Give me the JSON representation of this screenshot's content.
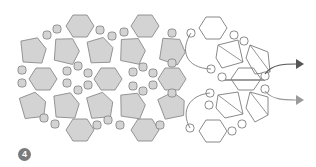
{
  "figure": {
    "step_number": "4",
    "colors": {
      "filled_shape": "#d3d3d3",
      "shape_stroke": "#8a8a8a",
      "outline_stroke": "#7c7c7c",
      "arrow_dark": "#555555",
      "arrow_light": "#9a9a9a",
      "badge": "#7a7a7a"
    }
  }
}
